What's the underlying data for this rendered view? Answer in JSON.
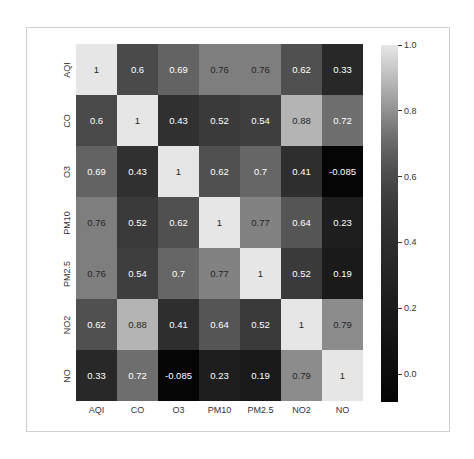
{
  "chart_data": {
    "type": "heatmap",
    "title": "",
    "xlabel": "",
    "ylabel": "",
    "categories": [
      "AQI",
      "CO",
      "O3",
      "PM10",
      "PM2.5",
      "NO2",
      "NO"
    ],
    "x_labels": [
      "AQI",
      "CO",
      "O3",
      "PM10",
      "PM2.5",
      "NO2",
      "NO"
    ],
    "y_labels": [
      "AQI",
      "CO",
      "O3",
      "PM10",
      "PM2.5",
      "NO2",
      "NO"
    ],
    "matrix": [
      [
        1,
        0.6,
        0.69,
        0.76,
        0.76,
        0.62,
        0.33
      ],
      [
        0.6,
        1,
        0.43,
        0.52,
        0.54,
        0.88,
        0.72
      ],
      [
        0.69,
        0.43,
        1,
        0.62,
        0.7,
        0.41,
        -0.085
      ],
      [
        0.76,
        0.52,
        0.62,
        1,
        0.77,
        0.64,
        0.23
      ],
      [
        0.76,
        0.54,
        0.7,
        0.77,
        1,
        0.52,
        0.19
      ],
      [
        0.62,
        0.88,
        0.41,
        0.64,
        0.52,
        1,
        0.79
      ],
      [
        0.33,
        0.72,
        -0.085,
        0.23,
        0.19,
        0.79,
        1
      ]
    ],
    "annotations": [
      [
        "1",
        "0.6",
        "0.69",
        "0.76",
        "0.76",
        "0.62",
        "0.33"
      ],
      [
        "0.6",
        "1",
        "0.43",
        "0.52",
        "0.54",
        "0.88",
        "0.72"
      ],
      [
        "0.69",
        "0.43",
        "1",
        "0.62",
        "0.7",
        "0.41",
        "-0.085"
      ],
      [
        "0.76",
        "0.52",
        "0.62",
        "1",
        "0.77",
        "0.64",
        "0.23"
      ],
      [
        "0.76",
        "0.54",
        "0.7",
        "0.77",
        "1",
        "0.52",
        "0.19"
      ],
      [
        "0.62",
        "0.88",
        "0.41",
        "0.64",
        "0.52",
        "1",
        "0.79"
      ],
      [
        "0.33",
        "0.72",
        "-0.085",
        "0.23",
        "0.19",
        "0.79",
        "1"
      ]
    ],
    "colorbar": {
      "ticks": [
        "1.0",
        "0.8",
        "0.6",
        "0.4",
        "0.2",
        "0.0"
      ],
      "tick_values": [
        1.0,
        0.8,
        0.6,
        0.4,
        0.2,
        0.0
      ],
      "range": [
        -0.085,
        1.0
      ],
      "colormap": "grayscale"
    },
    "colors": {
      "low": "#050505",
      "high": "#e6e6e6",
      "text_dark": "#262626",
      "text_light": "#ffffff"
    },
    "grid": false,
    "legend_position": "right"
  }
}
